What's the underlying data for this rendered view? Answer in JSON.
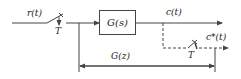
{
  "diagram": {
    "input_signal": "r(t)",
    "sampler_input_label": "T",
    "plant_block": "G(s)",
    "output_signal": "c(t)",
    "sampler_output_label": "T",
    "sampled_output_signal": "c*(t)",
    "pulse_transfer_label": "G(z)",
    "colors": {
      "line": "#444444",
      "text": "#222222",
      "background": "#ffffff"
    }
  }
}
